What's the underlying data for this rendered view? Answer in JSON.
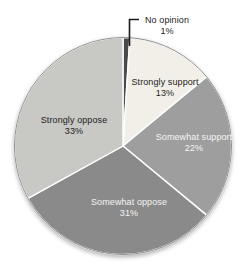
{
  "figure": {
    "background_color": "#ffffff"
  },
  "chart_data": {
    "type": "pie",
    "title": "",
    "start_angle_deg": 0,
    "direction": "clockwise",
    "labels_inside": true,
    "legend_position": "none",
    "outline_color": "#8f8f8f",
    "separator_color": "#ffffff",
    "slices": [
      {
        "label": "No opinion",
        "value": 1,
        "pct_label": "1%",
        "color": "#4a4a4a",
        "label_color": "#1c1c1c",
        "label_placement": "outside-callout"
      },
      {
        "label": "Strongly support",
        "value": 13,
        "pct_label": "13%",
        "color": "#f1efe7",
        "label_color": "#1c1c1c",
        "label_placement": "inside"
      },
      {
        "label": "Somewhat support",
        "value": 22,
        "pct_label": "22%",
        "color": "#9e9e9e",
        "label_color": "#f5f5f5",
        "label_placement": "inside"
      },
      {
        "label": "Somewhat oppose",
        "value": 31,
        "pct_label": "31%",
        "color": "#8a8a8a",
        "label_color": "#f5f5f5",
        "label_placement": "inside"
      },
      {
        "label": "Strongly oppose",
        "value": 33,
        "pct_label": "33%",
        "color": "#c8c8c5",
        "label_color": "#1c1c1c",
        "label_placement": "inside"
      }
    ]
  }
}
